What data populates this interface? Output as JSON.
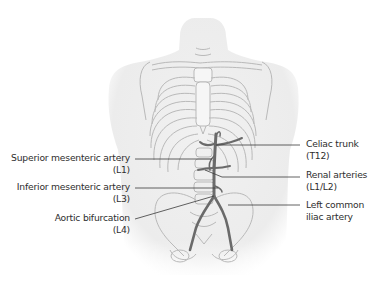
{
  "figure": {
    "colors": {
      "background": "#ffffff",
      "body_silhouette": "#ececec",
      "skeleton_stroke": "#b9b9b9",
      "artery": "#6a6a6a",
      "leader_line": "#3a3a3a",
      "label_text": "#2e2e2e"
    }
  },
  "labels": {
    "left": [
      {
        "name": "Superior mesenteric artery",
        "level": "(L1)"
      },
      {
        "name": "Inferior mesenteric artery",
        "level": "(L3)"
      },
      {
        "name": "Aortic bifurcation",
        "level": "(L4)"
      }
    ],
    "right": [
      {
        "name": "Celiac trunk",
        "level": "(T12)"
      },
      {
        "name": "Renal arteries",
        "level": "(L1/L2)"
      },
      {
        "name": "Left common",
        "level": "iliac artery"
      }
    ]
  }
}
